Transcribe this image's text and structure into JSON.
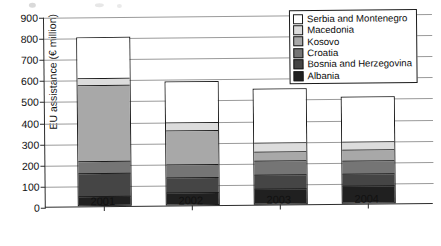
{
  "axes": {
    "y_title": "EU assistance (€ million)",
    "y_ticks": [
      "0",
      "100",
      "200",
      "300",
      "400",
      "500",
      "600",
      "700",
      "800",
      "900"
    ],
    "x_ticks": [
      "2001",
      "2002",
      "2003",
      "2004"
    ]
  },
  "legend": {
    "items": [
      {
        "label": "Serbia and Montenegro",
        "color": "#ffffff"
      },
      {
        "label": "Macedonia",
        "color": "#dcdcdc"
      },
      {
        "label": "Kosovo",
        "color": "#a8a8a8"
      },
      {
        "label": "Croatia",
        "color": "#757575"
      },
      {
        "label": "Bosnia and Herzegovina",
        "color": "#454545"
      },
      {
        "label": "Albania",
        "color": "#202020"
      }
    ]
  },
  "chart_data": {
    "type": "bar",
    "subtype": "stacked-vertical",
    "title": "",
    "xlabel": "",
    "ylabel": "EU assistance (€ million)",
    "ylim": [
      0,
      900
    ],
    "ytick_step": 100,
    "grid": true,
    "legend_position": "top-right",
    "categories": [
      "2001",
      "2002",
      "2003",
      "2004"
    ],
    "series": [
      {
        "name": "Albania",
        "color": "#202020",
        "values": [
          40,
          50,
          65,
          75
        ]
      },
      {
        "name": "Bosnia and Herzegovina",
        "color": "#454545",
        "values": [
          105,
          75,
          70,
          60
        ]
      },
      {
        "name": "Croatia",
        "color": "#757575",
        "values": [
          60,
          60,
          65,
          60
        ]
      },
      {
        "name": "Kosovo",
        "color": "#a8a8a8",
        "values": [
          360,
          160,
          40,
          50
        ]
      },
      {
        "name": "Macedonia",
        "color": "#dcdcdc",
        "values": [
          30,
          40,
          45,
          40
        ]
      },
      {
        "name": "Serbia and Montenegro",
        "color": "#ffffff",
        "values": [
          195,
          195,
          255,
          215
        ]
      }
    ],
    "totals": [
      790,
      580,
      540,
      500
    ]
  }
}
